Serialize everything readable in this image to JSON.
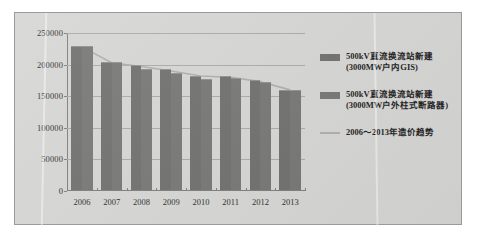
{
  "chart_data": {
    "type": "bar",
    "title": "",
    "subtitle": "",
    "xlabel": "",
    "ylabel": "",
    "categories": [
      "2006",
      "2007",
      "2008",
      "2009",
      "2010",
      "2011",
      "2012",
      "2013"
    ],
    "ylim": [
      0,
      250000
    ],
    "yticks": [
      0,
      50000,
      100000,
      150000,
      200000,
      250000
    ],
    "ytick_labels": [
      "0",
      "50000",
      "100000",
      "150000",
      "200000",
      "250000"
    ],
    "grid": true,
    "legend_position": "right",
    "series": [
      {
        "name": "500kV直流换流站新建\n(3000MW户内GIS)",
        "name_line1": "500kV直流换流站新建",
        "name_line2": "(3000MW户内GIS)",
        "color": "#6e6e6c",
        "values": [
          228000,
          202000,
          198000,
          191000,
          181000,
          180000,
          174000,
          159000
        ]
      },
      {
        "name": "500kV直流换流站新建\n(3000MW户外柱式断路器)",
        "name_line1": "500kV直流换流站新建",
        "name_line2": "(3000MW户外柱式断路器)",
        "color": "#757573",
        "values": [
          228000,
          202000,
          192000,
          185000,
          176000,
          178000,
          171000,
          159000
        ]
      }
    ],
    "trend_line": {
      "name": "2006～2013年造价趋势",
      "color": "#adadab",
      "x": [
        "2006",
        "2007",
        "2008",
        "2009",
        "2010",
        "2011",
        "2012",
        "2013"
      ],
      "values": [
        228000,
        203000,
        197000,
        190000,
        182000,
        180000,
        173000,
        160000
      ]
    }
  },
  "legend": {
    "items": [
      {
        "marker": "bar-swatch",
        "line1": "500kV直流换流站新建",
        "line2": "(3000MW户内GIS)"
      },
      {
        "marker": "bar-swatch",
        "line1": "500kV直流换流站新建",
        "line2": "(3000MW户外柱式断路器)"
      },
      {
        "marker": "trend-line",
        "line1": "2006～2013年造价趋势",
        "line2": ""
      }
    ]
  }
}
